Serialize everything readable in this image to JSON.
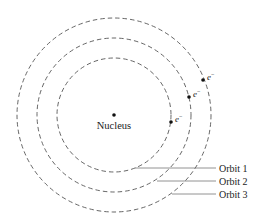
{
  "diagram": {
    "type": "bohr-atom-model",
    "nucleus": {
      "label": "Nucleus"
    },
    "electron_label": "e",
    "electron_charge": "−",
    "orbits": [
      {
        "label": "Orbit 1"
      },
      {
        "label": "Orbit 2"
      },
      {
        "label": "Orbit 3"
      }
    ]
  },
  "colors": {
    "orbit_stroke": "#555555",
    "leader_stroke": "#777777",
    "text": "#222222",
    "background": "#ffffff"
  }
}
